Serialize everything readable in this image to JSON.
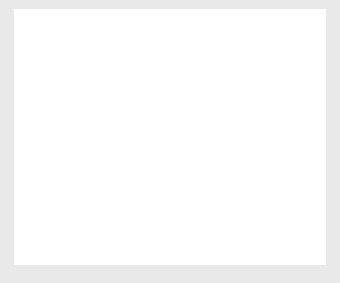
{
  "figure": {
    "background_color": "#e9e9e9",
    "panel_color": "#ffffff"
  },
  "chart_data": {
    "type": "line",
    "title": "",
    "xlabel": "Age (decades)",
    "ylabel": "Proportion (%)",
    "xlim": [
      1,
      8
    ],
    "ylim": [
      -5,
      25
    ],
    "grid": false,
    "legend_position": "upper left",
    "xticks": [
      1,
      2,
      3,
      4,
      5,
      6,
      7,
      8
    ],
    "xtick_labels": [
      "1",
      "2",
      "3",
      "4",
      "5",
      "6",
      "7",
      "8"
    ],
    "yticks": [
      -5,
      0,
      5,
      10,
      15,
      20,
      25
    ],
    "ytick_labels": [
      "−5",
      "0",
      "5",
      "10",
      "15",
      "20",
      "25"
    ],
    "series": [
      {
        "name": "Female",
        "color": "#8a8a8a",
        "x": [
          1.0,
          1.2,
          1.4,
          1.6,
          1.8,
          2.0,
          2.2,
          2.4,
          2.6,
          2.8,
          3.0,
          3.2,
          3.4,
          3.6,
          3.8,
          4.0,
          4.2,
          4.4,
          4.6,
          4.8,
          5.0,
          5.2,
          5.4,
          5.6,
          5.8,
          6.0,
          6.2,
          6.4,
          6.6,
          6.8,
          7.0,
          7.2,
          7.4,
          7.6,
          7.8,
          8.0
        ],
        "values": [
          0.0,
          0.05,
          0.1,
          0.15,
          0.2,
          0.25,
          0.3,
          0.4,
          0.6,
          1.0,
          1.6,
          3.0,
          5.2,
          7.6,
          9.8,
          11.0,
          11.5,
          11.3,
          10.8,
          10.5,
          10.6,
          11.4,
          13.4,
          16.8,
          20.4,
          22.3,
          21.6,
          18.6,
          13.8,
          8.6,
          4.4,
          2.0,
          0.8,
          0.3,
          0.1,
          0.0
        ]
      },
      {
        "name": "Male",
        "color": "#9a9a9a",
        "x": [
          1.0,
          1.2,
          1.4,
          1.6,
          1.8,
          2.0,
          2.2,
          2.4,
          2.6,
          2.8,
          3.0,
          3.2,
          3.4,
          3.6,
          3.8,
          4.0,
          4.2,
          4.4,
          4.6,
          4.8,
          5.0,
          5.2,
          5.4,
          5.6,
          5.8,
          6.0,
          6.2,
          6.4,
          6.6,
          6.8,
          7.0,
          7.2,
          7.4,
          7.6,
          7.8,
          8.0
        ],
        "values": [
          0.0,
          0.3,
          0.9,
          1.6,
          1.95,
          2.0,
          1.85,
          1.5,
          1.2,
          1.0,
          1.0,
          1.4,
          2.1,
          3.1,
          4.3,
          5.6,
          6.8,
          7.9,
          8.8,
          9.5,
          9.95,
          10.2,
          10.15,
          9.9,
          9.5,
          9.0,
          8.3,
          7.2,
          5.6,
          3.8,
          2.2,
          1.1,
          0.45,
          0.15,
          0.04,
          0.0
        ]
      }
    ],
    "annotations": []
  },
  "legend": {
    "entries": [
      "Female",
      "Male"
    ]
  }
}
